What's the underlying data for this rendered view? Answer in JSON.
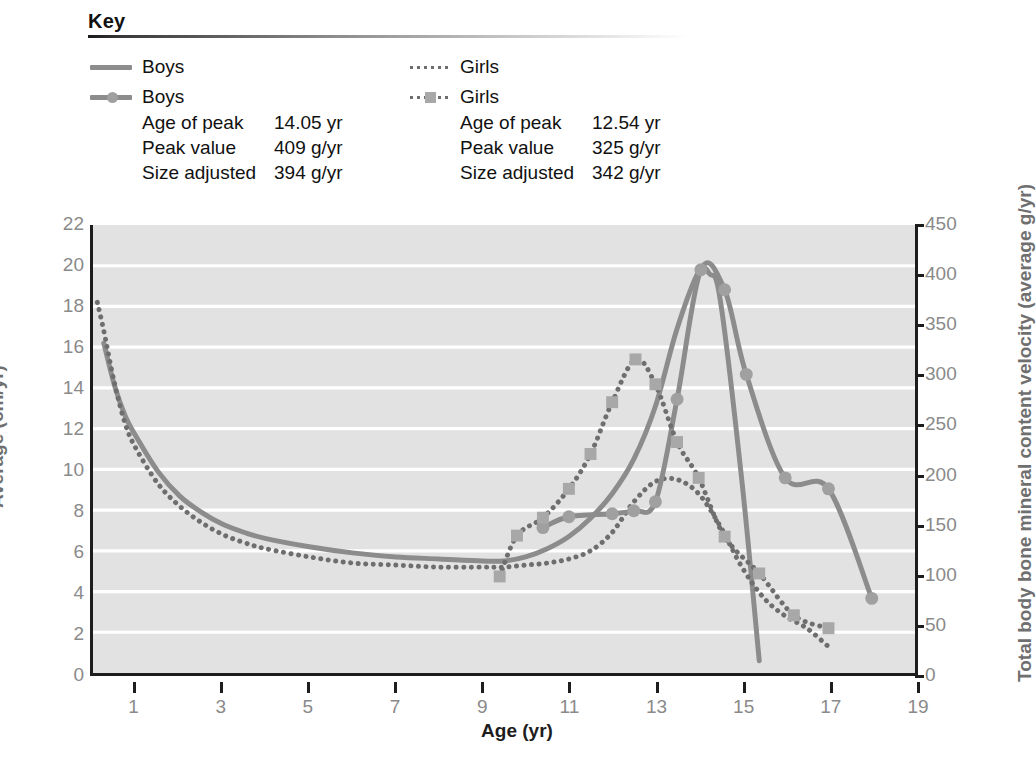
{
  "key": {
    "title": "Key",
    "columns": [
      {
        "line_entry": {
          "icon": "solid-line-swatch",
          "label": "Boys"
        },
        "marker_entry": {
          "icon": "solid-line-circle-marker-swatch",
          "label": "Boys"
        },
        "stats": [
          {
            "name": "Age of peak",
            "value": "14.05 yr"
          },
          {
            "name": "Peak value",
            "value": "409 g/yr"
          },
          {
            "name": "Size adjusted",
            "value": "394 g/yr"
          }
        ]
      },
      {
        "line_entry": {
          "icon": "dotted-line-swatch",
          "label": "Girls"
        },
        "marker_entry": {
          "icon": "dotted-line-square-marker-swatch",
          "label": "Girls"
        },
        "stats": [
          {
            "name": "Age of peak",
            "value": "12.54 yr"
          },
          {
            "name": "Peak value",
            "value": "325 g/yr"
          },
          {
            "name": "Size adjusted",
            "value": "342 g/yr"
          }
        ]
      }
    ]
  },
  "axes": {
    "y_left_label": "Average (cm/yr)",
    "y_right_label": "Total body bone mineral content velocity (average g/yr)",
    "x_label": "Age (yr)",
    "y_left_ticks": [
      "0",
      "2",
      "4",
      "6",
      "8",
      "10",
      "12",
      "14",
      "16",
      "18",
      "20",
      "22"
    ],
    "y_right_ticks": [
      "0",
      "50",
      "100",
      "150",
      "200",
      "250",
      "300",
      "350",
      "400",
      "450"
    ],
    "x_ticks": [
      "1",
      "3",
      "5",
      "7",
      "9",
      "11",
      "13",
      "15",
      "17",
      "19"
    ]
  },
  "caption": "",
  "colors": {
    "plot_background": "#e2e2e2",
    "gridline": "#ffffff",
    "axis": "#1d1d1d",
    "series_line": "#8c8c8c",
    "series_dotted": "#6e6e6e",
    "marker_fill": "#a0a0a0",
    "tick_text": "#8a8a8a",
    "axis_title": "#6f6f6f"
  },
  "chart_data": {
    "type": "line",
    "title": "",
    "xlabel": "Age (yr)",
    "ylabel": "Average (cm/yr)",
    "ylabel_secondary": "Total body bone mineral content velocity (average g/yr)",
    "xlim": [
      0,
      19
    ],
    "ylim": [
      0,
      22
    ],
    "ylim_secondary": [
      0,
      450
    ],
    "grid": "horizontal",
    "gridlines_y": [
      2,
      4,
      6,
      8,
      10,
      12,
      14,
      16,
      18,
      20
    ],
    "legend_position": "top",
    "annotations": [
      "Boys: Age of peak 14.05 yr; Peak value 409 g/yr; Size adjusted 394 g/yr",
      "Girls: Age of peak 12.54 yr; Peak value 325 g/yr; Size adjusted 342 g/yr"
    ],
    "series": [
      {
        "name": "Boys height velocity",
        "style": "solid",
        "axis": "left",
        "markers": false,
        "units": "cm/yr",
        "x": [
          0.25,
          0.5,
          0.75,
          1,
          1.5,
          2,
          2.5,
          3,
          3.5,
          4,
          5,
          6,
          7,
          8,
          9,
          9.5,
          10,
          10.5,
          11,
          11.5,
          12,
          12.5,
          13,
          13.5,
          14,
          14.25,
          14.5,
          15,
          15.4
        ],
        "y": [
          16.2,
          14.1,
          12.6,
          11.6,
          9.9,
          8.7,
          7.9,
          7.3,
          6.9,
          6.6,
          6.2,
          5.9,
          5.7,
          5.6,
          5.5,
          5.5,
          5.7,
          6.1,
          6.7,
          7.6,
          8.8,
          10.5,
          13.1,
          16.9,
          19.7,
          19.6,
          18.3,
          9.4,
          0.6
        ]
      },
      {
        "name": "Girls height velocity",
        "style": "dotted",
        "axis": "left",
        "markers": false,
        "units": "cm/yr",
        "x": [
          0.1,
          0.25,
          0.5,
          0.75,
          1,
          1.5,
          2,
          2.5,
          3,
          3.5,
          4,
          5,
          6,
          7,
          8,
          9,
          9.5,
          10,
          10.5,
          11,
          11.5,
          12,
          12.5,
          13,
          13.5,
          14,
          14.5,
          15,
          15.5,
          16,
          16.5,
          17,
          17.1
        ],
        "y": [
          18.2,
          16.8,
          14.2,
          12.2,
          11.0,
          9.3,
          8.2,
          7.4,
          6.8,
          6.4,
          6.1,
          5.7,
          5.4,
          5.3,
          5.2,
          5.2,
          5.2,
          5.3,
          5.4,
          5.6,
          6.0,
          6.9,
          8.4,
          9.4,
          9.5,
          8.8,
          7.2,
          5.2,
          3.7,
          2.8,
          2.2,
          1.3,
          1.2
        ]
      },
      {
        "name": "Boys bone mineral content velocity",
        "style": "solid",
        "axis": "right",
        "markers": "circle",
        "units": "g/yr",
        "x": [
          10.4,
          11.0,
          12.0,
          12.5,
          13.0,
          13.5,
          14.05,
          14.6,
          15.1,
          16.0,
          17.0,
          18.0
        ],
        "y": [
          146,
          157,
          160,
          163,
          172,
          275,
          405,
          385,
          300,
          196,
          185,
          75
        ]
      },
      {
        "name": "Girls bone mineral content velocity",
        "style": "dotted",
        "axis": "right",
        "markers": "square",
        "units": "g/yr",
        "x": [
          9.4,
          9.8,
          10.4,
          11.0,
          11.5,
          12.0,
          12.54,
          13.0,
          13.5,
          14.0,
          14.6,
          15.4,
          16.2,
          17.0
        ],
        "y": [
          97,
          138,
          156,
          185,
          220,
          272,
          315,
          290,
          232,
          196,
          137,
          100,
          58,
          45
        ]
      }
    ],
    "series_right_axis_values_as_left_units": {
      "note": "right-axis series plotted against the 0-450 g/yr scale",
      "boys_peak": {
        "age": 14.05,
        "value": 409
      },
      "girls_peak": {
        "age": 12.54,
        "value": 325
      }
    }
  }
}
